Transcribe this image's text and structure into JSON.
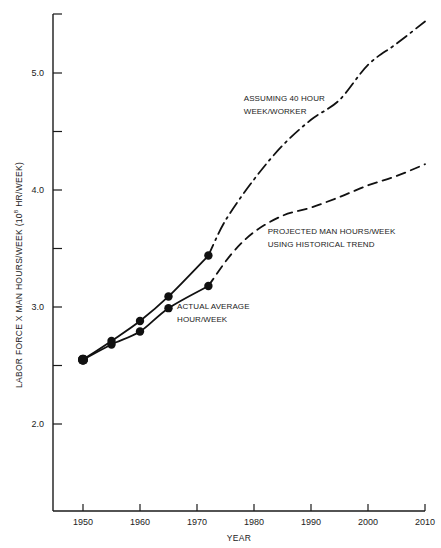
{
  "chart_data": {
    "type": "line",
    "title": "",
    "xlabel": "YEAR",
    "ylabel": "LABOR FORCE X MAN HOURS/WEEK (10^8 HR/WEEK)",
    "ylabel_parts": {
      "before": "LABOR FORCE X MAN HOURS/WEEK (10",
      "superscript": "8",
      "after": " HR/WEEK)"
    },
    "xlim": [
      1945,
      2010
    ],
    "ylim": [
      1.3,
      5.85
    ],
    "x_ticks": [
      1950,
      1960,
      1970,
      1980,
      1990,
      2000,
      2010
    ],
    "x_tick_labels": [
      "1950",
      "1960",
      "1970",
      "1980",
      "1990",
      "2000",
      "2010"
    ],
    "y_ticks": [
      2.0,
      2.5,
      3.0,
      3.5,
      4.0,
      4.5,
      5.0
    ],
    "y_tick_labels": {
      "2.0": "2.0",
      "3.0": "3.0",
      "4.0": "4.0",
      "5.0": "5.0"
    },
    "grid": false,
    "legend": "none (inline annotations)",
    "series": [
      {
        "name": "Labor force x 40 hr/week (historical)",
        "style": "solid",
        "markers": true,
        "x": [
          1950,
          1955,
          1960,
          1965,
          1972
        ],
        "y": [
          2.55,
          2.71,
          2.88,
          3.09,
          3.44
        ]
      },
      {
        "name": "Assuming 40 hour week/worker (projection)",
        "style": "dash-dot",
        "markers": false,
        "x": [
          1972,
          1975,
          1980,
          1985,
          1990,
          1995,
          2000,
          2005,
          2010
        ],
        "y": [
          3.44,
          3.74,
          4.09,
          4.38,
          4.6,
          4.77,
          5.07,
          5.25,
          5.44
        ]
      },
      {
        "name": "Actual average hour/week (historical)",
        "style": "solid",
        "markers": true,
        "x": [
          1950,
          1955,
          1960,
          1965,
          1972
        ],
        "y": [
          2.55,
          2.68,
          2.79,
          2.99,
          3.18
        ]
      },
      {
        "name": "Projected man hours/week using historical trend",
        "style": "dashed",
        "markers": false,
        "x": [
          1972,
          1976,
          1980,
          1985,
          1990,
          1995,
          2000,
          2005,
          2010
        ],
        "y": [
          3.18,
          3.45,
          3.64,
          3.78,
          3.85,
          3.94,
          4.04,
          4.12,
          4.22
        ]
      }
    ],
    "annotations": [
      {
        "lines": [
          "ASSUMING 40 HOUR",
          "WEEK/WORKER"
        ],
        "x": 1978.2,
        "y": 4.76
      },
      {
        "lines": [
          "PROJECTED MAN HOURS/WEEK",
          "USING HISTORICAL TREND"
        ],
        "x": 1982.4,
        "y": 3.62
      },
      {
        "lines": [
          "ACTUAL AVERAGE",
          "HOUR/WEEK"
        ],
        "x": 1966.5,
        "y": 2.98
      }
    ]
  }
}
